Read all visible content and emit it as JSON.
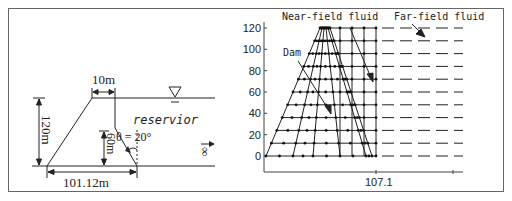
{
  "left_diagram": {
    "dim_top_width": "10m",
    "dim_height": "120m",
    "dim_lower_height": "60m",
    "dim_base_width": "101.12m",
    "reservoir_label": "reservior",
    "angle_label": "θ = 20°",
    "infinity_label": "∞",
    "water_level_symbol": "water-surface-triangle"
  },
  "right_plot": {
    "label_near_field": "Near-field fluid",
    "label_far_field": "Far-field fluid",
    "label_dam": "Dam",
    "x_tick_label": "107.1",
    "y_ticks": [
      "0",
      "20",
      "40",
      "60",
      "80",
      "100",
      "120"
    ]
  },
  "chart_data": {
    "type": "scatter",
    "title": "",
    "xlabel": "",
    "ylabel": "",
    "x_tick_labels": [
      "107.1"
    ],
    "y_tick_labels": [
      0,
      20,
      40,
      60,
      80,
      100,
      120
    ],
    "ylim": [
      0,
      120
    ],
    "annotations": [
      "Near-field fluid",
      "Far-field fluid",
      "Dam"
    ],
    "mesh_levels_y": [
      0,
      12,
      24,
      36,
      48,
      60,
      72,
      84,
      96,
      108,
      120
    ],
    "grid": false
  },
  "colors": {
    "line": "#222222",
    "frame": "#555555",
    "background": "#ffffff"
  }
}
